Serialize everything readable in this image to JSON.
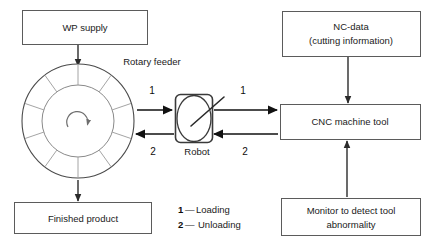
{
  "diagram": {
    "title_present": false,
    "boxes": [
      {
        "id": "wp-supply",
        "label": "WP supply"
      },
      {
        "id": "finished-product",
        "label": "Finished product"
      },
      {
        "id": "nc-data",
        "label_line1": "NC-data",
        "label_line2": "(cutting information)"
      },
      {
        "id": "cnc-machine",
        "label": "CNC machine tool"
      },
      {
        "id": "monitor",
        "label_line1": "Monitor to detect tool",
        "label_line2": "abnormality"
      }
    ],
    "labels": {
      "rotary_feeder": "Rotary feeder",
      "robot": "Robot"
    },
    "flow_markers": {
      "feeder_to_robot": "1",
      "robot_to_cnc": "1",
      "cnc_to_robot": "2",
      "robot_to_feeder": "2"
    },
    "legend": [
      {
        "num": "1",
        "dash": "—",
        "text": "Loading"
      },
      {
        "num": "2",
        "dash": "—",
        "text": "Unloading"
      }
    ],
    "colors": {
      "background": "#ffffff",
      "box_stroke": "#5b5b5b",
      "text": "#1a1a1a",
      "arrow": "#111111",
      "feeder_stroke": "#4a4a4a",
      "robot_stroke": "#3a3a3a"
    },
    "feeder": {
      "segment_count": 10,
      "rotation_direction": "clockwise"
    }
  }
}
